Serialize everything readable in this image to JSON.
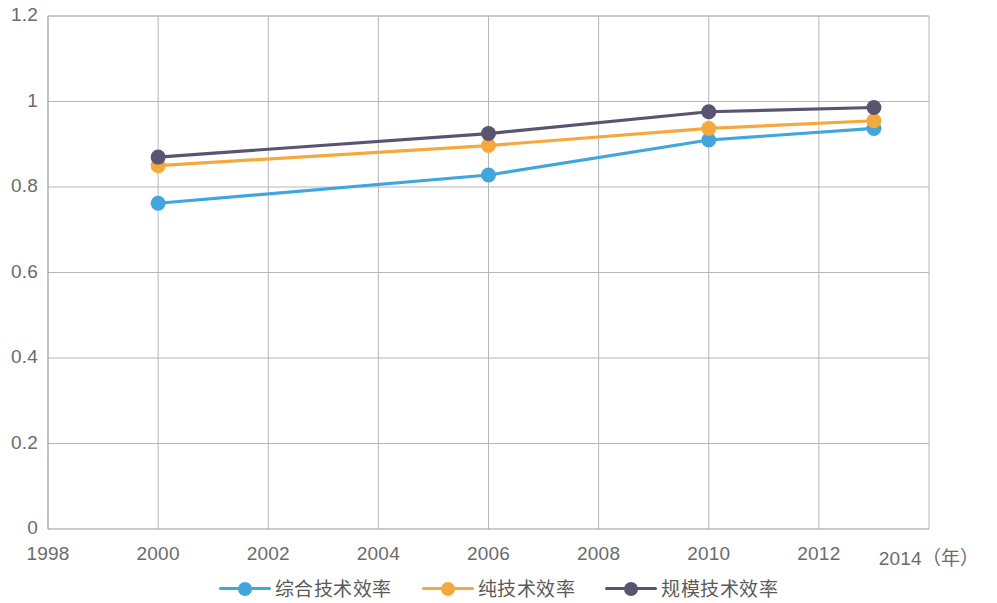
{
  "chart_data": {
    "type": "line",
    "title": "",
    "xlabel": "年",
    "ylabel": "",
    "x": [
      2000,
      2006,
      2010,
      2013
    ],
    "xlim": [
      1998,
      2014
    ],
    "ylim": [
      0,
      1.2
    ],
    "grid": true,
    "legend_position": "bottom",
    "x_tick_labels": [
      "1998",
      "2000",
      "2002",
      "2004",
      "2006",
      "2008",
      "2010",
      "2012",
      "2014（年）"
    ],
    "x_tick_values": [
      1998,
      2000,
      2002,
      2004,
      2006,
      2008,
      2010,
      2012,
      2014
    ],
    "y_tick_labels": [
      "0",
      "0.2",
      "0.4",
      "0.6",
      "0.8",
      "1",
      "1.2"
    ],
    "y_tick_values": [
      0,
      0.2,
      0.4,
      0.6,
      0.8,
      1,
      1.2
    ],
    "series": [
      {
        "name": "综合技术效率",
        "color": "#41a6dd",
        "values": [
          0.762,
          0.828,
          0.91,
          0.937
        ]
      },
      {
        "name": "纯技术效率",
        "color": "#f5a93c",
        "values": [
          0.85,
          0.897,
          0.937,
          0.955
        ]
      },
      {
        "name": "规模技术效率",
        "color": "#5b5470",
        "values": [
          0.87,
          0.925,
          0.976,
          0.986
        ]
      }
    ]
  },
  "axes": {
    "grid_color": "#b7b7b7",
    "axis_color": "#9a9a9a",
    "tick_text_color": "#6b6b6b"
  },
  "legend": {
    "items": [
      {
        "label": "综合技术效率",
        "color": "#41a6dd"
      },
      {
        "label": "纯技术效率",
        "color": "#f5a93c"
      },
      {
        "label": "规模技术效率",
        "color": "#5b5470"
      }
    ]
  }
}
